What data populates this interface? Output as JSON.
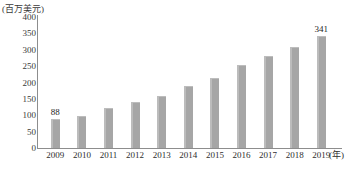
{
  "chart_data": {
    "type": "bar",
    "title": "",
    "subtitle": "",
    "unit_label": "(百万美元)",
    "xlabel": "(年)",
    "ylabel": "",
    "categories": [
      "2009",
      "2010",
      "2011",
      "2012",
      "2013",
      "2014",
      "2015",
      "2016",
      "2017",
      "2018",
      "2019"
    ],
    "values": [
      88,
      98,
      122,
      140,
      160,
      188,
      215,
      252,
      280,
      308,
      341
    ],
    "data_labels": {
      "2009": "88",
      "2019": "341"
    },
    "ylim": [
      0,
      400
    ],
    "ytick_labels": [
      "400",
      "350",
      "300",
      "250",
      "200",
      "150",
      "100",
      "50",
      "0"
    ],
    "ytick_values": [
      400,
      350,
      300,
      250,
      200,
      150,
      100,
      50,
      0
    ],
    "ytick_step": 50,
    "grid": false,
    "legend": "none",
    "series_color": "#a6a6a6",
    "axis_color": "#8d8d8d",
    "text_color": "#2e2e2e"
  }
}
